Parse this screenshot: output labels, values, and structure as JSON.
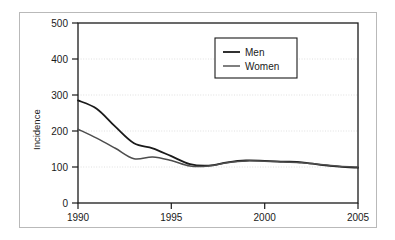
{
  "chart_data": {
    "type": "line",
    "title": "",
    "xlabel": "",
    "ylabel": "Incidence",
    "xlim": [
      1990,
      2005
    ],
    "ylim": [
      0,
      500
    ],
    "xticks": [
      1990,
      1995,
      2000,
      2005
    ],
    "yticks": [
      0,
      100,
      200,
      300,
      400,
      500
    ],
    "xtick_labels": [
      "1990",
      "1995",
      "2000",
      "2005"
    ],
    "ytick_labels": [
      "0",
      "100",
      "200",
      "300",
      "400",
      "500"
    ],
    "grid": true,
    "grid_style": "dotted-light-horizontal",
    "legend_position": "upper-center-right",
    "x": [
      1990,
      1991,
      1992,
      1993,
      1994,
      1995,
      1996,
      1997,
      1998,
      1999,
      2000,
      2001,
      2002,
      2003,
      2004,
      2005
    ],
    "series": [
      {
        "name": "Men",
        "color": "#1a1a1a",
        "values": [
          285,
          262,
          212,
          166,
          152,
          130,
          108,
          104,
          113,
          118,
          117,
          115,
          113,
          106,
          101,
          98
        ]
      },
      {
        "name": "Women",
        "color": "#4d4d4d",
        "values": [
          205,
          180,
          152,
          123,
          128,
          118,
          103,
          103,
          112,
          117,
          116,
          114,
          112,
          107,
          102,
          100
        ]
      }
    ]
  },
  "legend": {
    "entries": [
      {
        "label": "Men"
      },
      {
        "label": "Women"
      }
    ]
  },
  "axes": {
    "y_axis_title": "Incidence"
  }
}
